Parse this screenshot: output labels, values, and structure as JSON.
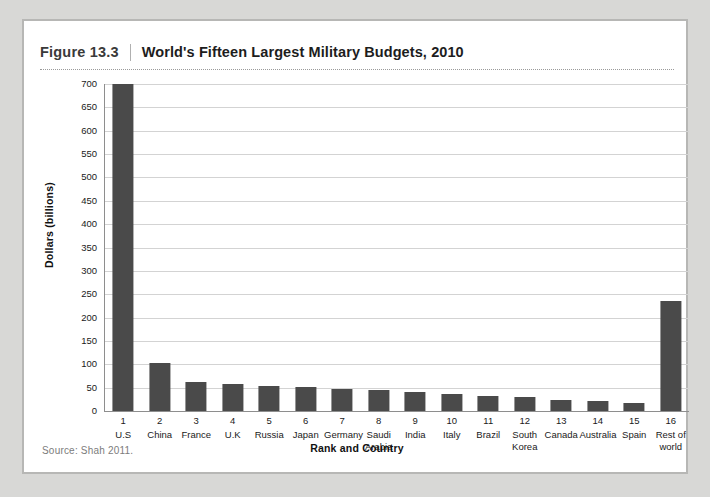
{
  "figure": {
    "number": "Figure 13.3",
    "title": "World's Fifteen Largest Military Budgets, 2010",
    "source": "Source: Shah 2011."
  },
  "chart_data": {
    "type": "bar",
    "title": "World's Fifteen Largest Military Budgets, 2010",
    "xlabel": "Rank and Country",
    "ylabel": "Dollars (billions)",
    "ylim": [
      0,
      700
    ],
    "ytick_step": 50,
    "yticks": [
      700,
      650,
      600,
      550,
      500,
      450,
      400,
      350,
      300,
      250,
      200,
      150,
      100,
      50,
      0
    ],
    "grid": true,
    "legend": "none",
    "bar_color": "#4a4a4a",
    "ranks": [
      "1",
      "2",
      "3",
      "4",
      "5",
      "6",
      "7",
      "8",
      "9",
      "10",
      "11",
      "12",
      "13",
      "14",
      "15",
      "16"
    ],
    "categories": [
      "U.S",
      "China",
      "France",
      "U.K",
      "Russia",
      "Japan",
      "Germany",
      "Saudi Arabia",
      "India",
      "Italy",
      "Brazil",
      "South Korea",
      "Canada",
      "Australia",
      "Spain",
      "Rest of world"
    ],
    "values": [
      700,
      102,
      63,
      58,
      53,
      52,
      48,
      45,
      41,
      37,
      33,
      30,
      23,
      22,
      18,
      235
    ]
  }
}
